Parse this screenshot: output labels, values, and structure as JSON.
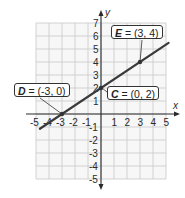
{
  "chart_data": {
    "type": "line",
    "title": "",
    "xlabel": "x",
    "ylabel": "y",
    "xlim": [
      -5,
      5
    ],
    "ylim": [
      -5,
      7
    ],
    "grid": true,
    "x_ticks": [
      "-5",
      "-4",
      "-3",
      "-2",
      "-1",
      "1",
      "2",
      "3",
      "4",
      "5"
    ],
    "y_ticks": [
      "7",
      "6",
      "5",
      "4",
      "3",
      "2",
      "1",
      "-1",
      "-2",
      "-3",
      "-4",
      "-5"
    ],
    "series": [
      {
        "name": "line through D, C, E",
        "equation": "y = (2/3)x + 2",
        "points": [
          {
            "label": "D",
            "x": -3,
            "y": 0
          },
          {
            "label": "C",
            "x": 0,
            "y": 2
          },
          {
            "label": "E",
            "x": 3,
            "y": 4
          }
        ]
      }
    ],
    "annotations": [
      {
        "name": "D",
        "text": "(-3, 0)"
      },
      {
        "name": "C",
        "text": "(0, 2)"
      },
      {
        "name": "E",
        "text": "(3, 4)"
      }
    ]
  },
  "labels": {
    "x_axis": "x",
    "y_axis": "y",
    "D": {
      "name": "D",
      "eq": " = ",
      "coords": "(-3, 0)"
    },
    "C": {
      "name": "C",
      "eq": " = ",
      "coords": "(0, 2)"
    },
    "E": {
      "name": "E",
      "eq": " = ",
      "coords": "(3, 4)"
    }
  },
  "colors": {
    "line": "#3a3a3a",
    "grid": "#c8c8c8",
    "axis": "#2a2a2a"
  }
}
